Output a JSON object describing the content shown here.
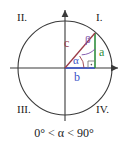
{
  "figure": {
    "title_caption": "0° < α < 90°",
    "quadrants": [
      {
        "id": "q1",
        "label": "I."
      },
      {
        "id": "q2",
        "label": "II."
      },
      {
        "id": "q3",
        "label": "III."
      },
      {
        "id": "q4",
        "label": "IV."
      }
    ],
    "sides": [
      {
        "id": "c",
        "label": "c",
        "color": "#9b3b46",
        "role": "hypotenuse"
      },
      {
        "id": "a",
        "label": "a",
        "color": "#2f8f3e",
        "role": "opposite-leg"
      },
      {
        "id": "b",
        "label": "b",
        "color": "#3a53c8",
        "role": "adjacent-leg"
      }
    ],
    "angles": [
      {
        "id": "alpha",
        "label": "α",
        "color": "#3a53c8",
        "vertex": "origin"
      },
      {
        "id": "beta",
        "label": "β",
        "color": "#7b4fa8",
        "vertex": "top"
      }
    ],
    "markers": {
      "right_angle": "right-angle-square"
    },
    "colors": {
      "axis": "#3a3a3a",
      "circle": "#3a3a3a",
      "hypotenuse": "#9b3b46",
      "leg_a": "#2f8f3e",
      "leg_b": "#3a53c8",
      "angle_alpha_arc": "#9b3b46",
      "angle_beta_arc": "#7b4fa8",
      "text": "#1a1a1a",
      "background": "#ffffff"
    },
    "geometry": {
      "center": [
        65,
        68
      ],
      "radius": 47,
      "point_on_circle": [
        95,
        33
      ]
    }
  }
}
